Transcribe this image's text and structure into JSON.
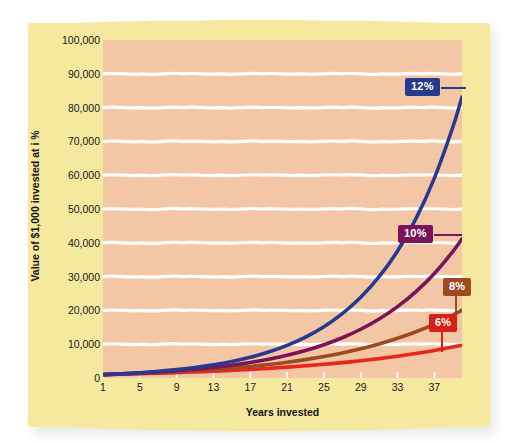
{
  "chart_data": {
    "type": "line",
    "title": "",
    "xlabel": "Years invested",
    "ylabel": "Value of $1,000 invested at i %",
    "xlim": [
      1,
      40
    ],
    "ylim": [
      0,
      100000
    ],
    "grid": true,
    "legend_position": "inline-callouts",
    "x_ticks": [
      "1",
      "5",
      "9",
      "13",
      "17",
      "21",
      "25",
      "29",
      "33",
      "37"
    ],
    "y_ticks": [
      "0",
      "10,000",
      "20,000",
      "30,000",
      "40,000",
      "50,000",
      "60,000",
      "70,000",
      "80,000",
      "90,000",
      "100,000"
    ],
    "x": [
      1,
      3,
      5,
      7,
      9,
      11,
      13,
      15,
      17,
      19,
      21,
      23,
      25,
      27,
      29,
      31,
      33,
      35,
      37,
      39,
      40
    ],
    "series": [
      {
        "name": "6%",
        "label": "6%",
        "color": "#e8261c",
        "values": [
          1000,
          1124,
          1262,
          1419,
          1594,
          1791,
          2012,
          2261,
          2540,
          2854,
          3207,
          3604,
          4049,
          4549,
          5112,
          5743,
          6453,
          7251,
          8147,
          9154,
          9704
        ]
      },
      {
        "name": "8%",
        "label": "8%",
        "color": "#9c4a22",
        "values": [
          1000,
          1166,
          1360,
          1587,
          1851,
          2159,
          2518,
          2937,
          3426,
          3996,
          4661,
          5437,
          6341,
          7396,
          8627,
          10063,
          11737,
          13690,
          15968,
          18625,
          20115
        ]
      },
      {
        "name": "10%",
        "label": "10%",
        "color": "#7b1358",
        "values": [
          1000,
          1210,
          1464,
          1772,
          2144,
          2594,
          3138,
          3797,
          4595,
          5560,
          6727,
          8140,
          9850,
          11918,
          14421,
          17449,
          21114,
          25548,
          30913,
          37404,
          41145
        ]
      },
      {
        "name": "12%",
        "label": "12%",
        "color": "#283a8e",
        "values": [
          1000,
          1254,
          1574,
          1974,
          2476,
          3106,
          3896,
          4887,
          6130,
          7690,
          9646,
          12100,
          15179,
          19040,
          23884,
          29960,
          37582,
          47143,
          59136,
          74180,
          83081
        ]
      }
    ]
  },
  "axes": {
    "y_title": "Value of $1,000 invested at i %",
    "x_title": "Years invested"
  },
  "colors": {
    "card_background": "#f5e9a0",
    "plot_background": "#f3c7a6",
    "gridline": "#ffffff",
    "series_6": "#e8261c",
    "series_8": "#9c4a22",
    "series_10": "#7b1358",
    "series_12": "#283a8e"
  },
  "callouts": [
    {
      "label": "12%",
      "bg": "#283a8e"
    },
    {
      "label": "10%",
      "bg": "#7b1358"
    },
    {
      "label": "8%",
      "bg": "#9c4a22"
    },
    {
      "label": "6%",
      "bg": "#d62119"
    }
  ]
}
